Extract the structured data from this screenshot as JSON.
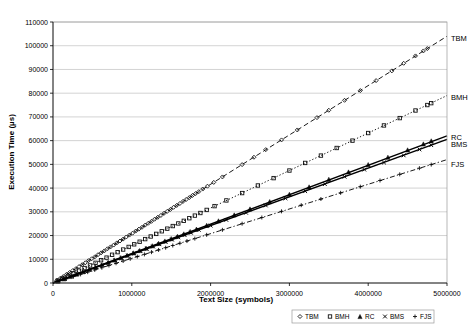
{
  "chart_data": {
    "type": "scatter",
    "title": "",
    "xlabel": "Text Size (symbols)",
    "ylabel": "Execution Time (µs)",
    "xlim": [
      0,
      5000000
    ],
    "ylim": [
      0,
      110000
    ],
    "xticks": [
      0,
      1000000,
      2000000,
      3000000,
      4000000,
      5000000
    ],
    "xtick_labels": [
      "0",
      "1000000",
      "2000000",
      "3000000",
      "4000000",
      "5000000"
    ],
    "yticks": [
      0,
      10000,
      20000,
      30000,
      40000,
      50000,
      60000,
      70000,
      80000,
      90000,
      100000,
      110000
    ],
    "ytick_labels": [
      "0",
      "10000",
      "20000",
      "30000",
      "40000",
      "50000",
      "60000",
      "70000",
      "80000",
      "90000",
      "100000",
      "110000"
    ],
    "grid": "horizontal",
    "legend_position": "below-right",
    "legend_entries": [
      {
        "label": "TBM",
        "marker": "diamond"
      },
      {
        "label": "BMH",
        "marker": "square"
      },
      {
        "label": "RC",
        "marker": "triangle"
      },
      {
        "label": "BMS",
        "marker": "cross-x"
      },
      {
        "label": "FJS",
        "marker": "plus"
      }
    ],
    "series": [
      {
        "name": "TBM",
        "marker": "diamond",
        "trend_style": "dashed",
        "slope_per_symbol": 0.0208,
        "end_label": "TBM",
        "end_label_y": 103000,
        "points": [
          [
            50000,
            1100
          ],
          [
            90000,
            1900
          ],
          [
            130000,
            2700
          ],
          [
            170000,
            3600
          ],
          [
            210000,
            4400
          ],
          [
            250000,
            5200
          ],
          [
            290000,
            6000
          ],
          [
            330000,
            6900
          ],
          [
            370000,
            7700
          ],
          [
            410000,
            8500
          ],
          [
            450000,
            9400
          ],
          [
            490000,
            10200
          ],
          [
            530000,
            11000
          ],
          [
            570000,
            11900
          ],
          [
            610000,
            12700
          ],
          [
            650000,
            13500
          ],
          [
            690000,
            14400
          ],
          [
            730000,
            15200
          ],
          [
            770000,
            16000
          ],
          [
            810000,
            16900
          ],
          [
            850000,
            17700
          ],
          [
            890000,
            18500
          ],
          [
            930000,
            19400
          ],
          [
            970000,
            20200
          ],
          [
            1010000,
            21000
          ],
          [
            1050000,
            21900
          ],
          [
            1090000,
            22700
          ],
          [
            1130000,
            23500
          ],
          [
            1170000,
            24400
          ],
          [
            1210000,
            25200
          ],
          [
            1250000,
            26000
          ],
          [
            1290000,
            26900
          ],
          [
            1330000,
            27700
          ],
          [
            1370000,
            28500
          ],
          [
            1410000,
            29400
          ],
          [
            1450000,
            30200
          ],
          [
            1490000,
            31000
          ],
          [
            1530000,
            31900
          ],
          [
            1570000,
            32700
          ],
          [
            1610000,
            33500
          ],
          [
            1650000,
            34400
          ],
          [
            1690000,
            35200
          ],
          [
            1730000,
            36000
          ],
          [
            1770000,
            36900
          ],
          [
            1810000,
            37700
          ],
          [
            1850000,
            38500
          ],
          [
            1900000,
            39600
          ],
          [
            1960000,
            40800
          ],
          [
            2040000,
            42400
          ],
          [
            2150000,
            44700
          ],
          [
            2400000,
            49900
          ],
          [
            2550000,
            53000
          ],
          [
            2700000,
            56200
          ],
          [
            2900000,
            60300
          ],
          [
            3100000,
            64500
          ],
          [
            3350000,
            69700
          ],
          [
            3500000,
            72800
          ],
          [
            3700000,
            77000
          ],
          [
            3900000,
            81100
          ],
          [
            4100000,
            85300
          ],
          [
            4300000,
            89400
          ],
          [
            4450000,
            92600
          ],
          [
            4600000,
            95700
          ],
          [
            4700000,
            97800
          ],
          [
            4750000,
            98800
          ]
        ]
      },
      {
        "name": "BMH",
        "marker": "square",
        "trend_style": "dotted",
        "slope_per_symbol": 0.0158,
        "end_label": "BMH",
        "end_label_y": 78000,
        "points": [
          [
            60000,
            1000
          ],
          [
            120000,
            1900
          ],
          [
            190000,
            3000
          ],
          [
            260000,
            4100
          ],
          [
            330000,
            5200
          ],
          [
            400000,
            6300
          ],
          [
            470000,
            7400
          ],
          [
            540000,
            8500
          ],
          [
            610000,
            9600
          ],
          [
            680000,
            10700
          ],
          [
            750000,
            11900
          ],
          [
            820000,
            13000
          ],
          [
            890000,
            14100
          ],
          [
            960000,
            15200
          ],
          [
            1030000,
            16300
          ],
          [
            1100000,
            17400
          ],
          [
            1170000,
            18500
          ],
          [
            1240000,
            19600
          ],
          [
            1310000,
            20700
          ],
          [
            1380000,
            21800
          ],
          [
            1450000,
            22900
          ],
          [
            1520000,
            24000
          ],
          [
            1590000,
            25100
          ],
          [
            1660000,
            26200
          ],
          [
            1730000,
            27300
          ],
          [
            1800000,
            28400
          ],
          [
            1870000,
            29500
          ],
          [
            1950000,
            30800
          ],
          [
            2050000,
            32400
          ],
          [
            2200000,
            34800
          ],
          [
            2400000,
            37900
          ],
          [
            2600000,
            41100
          ],
          [
            2800000,
            44200
          ],
          [
            3000000,
            47400
          ],
          [
            3200000,
            50600
          ],
          [
            3400000,
            53700
          ],
          [
            3600000,
            56900
          ],
          [
            3800000,
            60000
          ],
          [
            4000000,
            63200
          ],
          [
            4200000,
            66400
          ],
          [
            4400000,
            69500
          ],
          [
            4600000,
            72700
          ],
          [
            4750000,
            75000
          ],
          [
            4800000,
            75800
          ]
        ]
      },
      {
        "name": "RC",
        "marker": "triangle",
        "trend_style": "solid",
        "slope_per_symbol": 0.0124,
        "end_label": "RC",
        "end_label_y": 61500,
        "points": [
          [
            60000,
            750
          ],
          [
            140000,
            1750
          ],
          [
            220000,
            2750
          ],
          [
            300000,
            3750
          ],
          [
            380000,
            4750
          ],
          [
            460000,
            5750
          ],
          [
            540000,
            6750
          ],
          [
            620000,
            7700
          ],
          [
            700000,
            8700
          ],
          [
            780000,
            9700
          ],
          [
            860000,
            10700
          ],
          [
            940000,
            11700
          ],
          [
            1020000,
            12700
          ],
          [
            1100000,
            13700
          ],
          [
            1180000,
            14700
          ],
          [
            1260000,
            15700
          ],
          [
            1340000,
            16700
          ],
          [
            1420000,
            17700
          ],
          [
            1500000,
            18700
          ],
          [
            1580000,
            19700
          ],
          [
            1660000,
            20700
          ],
          [
            1740000,
            21700
          ],
          [
            1820000,
            22700
          ],
          [
            1950000,
            24300
          ],
          [
            2100000,
            26200
          ],
          [
            2300000,
            28700
          ],
          [
            2500000,
            31200
          ],
          [
            2750000,
            34300
          ],
          [
            3000000,
            37400
          ],
          [
            3250000,
            40500
          ],
          [
            3500000,
            43700
          ],
          [
            3750000,
            46800
          ],
          [
            4000000,
            49900
          ],
          [
            4250000,
            53000
          ],
          [
            4500000,
            56100
          ],
          [
            4700000,
            58600
          ],
          [
            4800000,
            59900
          ]
        ]
      },
      {
        "name": "BMS",
        "marker": "cross-x",
        "trend_style": "solid",
        "slope_per_symbol": 0.0121,
        "end_label": "BMS",
        "end_label_y": 58500,
        "points": [
          [
            70000,
            850
          ],
          [
            150000,
            1820
          ],
          [
            230000,
            2790
          ],
          [
            310000,
            3760
          ],
          [
            390000,
            4720
          ],
          [
            470000,
            5690
          ],
          [
            550000,
            6660
          ],
          [
            630000,
            7630
          ],
          [
            710000,
            8600
          ],
          [
            790000,
            9560
          ],
          [
            870000,
            10530
          ],
          [
            950000,
            11500
          ],
          [
            1030000,
            12470
          ],
          [
            1110000,
            13440
          ],
          [
            1190000,
            14400
          ],
          [
            1270000,
            15370
          ],
          [
            1350000,
            16340
          ],
          [
            1430000,
            17310
          ],
          [
            1510000,
            18280
          ],
          [
            1590000,
            19240
          ],
          [
            1670000,
            20210
          ],
          [
            1750000,
            21180
          ],
          [
            1850000,
            22400
          ],
          [
            2000000,
            24200
          ],
          [
            2200000,
            26600
          ],
          [
            2450000,
            29600
          ],
          [
            2700000,
            32700
          ],
          [
            2950000,
            35700
          ],
          [
            3200000,
            38700
          ],
          [
            3450000,
            41700
          ],
          [
            3700000,
            44800
          ],
          [
            3950000,
            47800
          ],
          [
            4200000,
            50800
          ],
          [
            4450000,
            53800
          ],
          [
            4650000,
            56300
          ],
          [
            4800000,
            58100
          ]
        ]
      },
      {
        "name": "FJS",
        "marker": "plus",
        "trend_style": "dash-dot",
        "slope_per_symbol": 0.0104,
        "end_label": "FJS",
        "end_label_y": 50000,
        "points": [
          [
            80000,
            830
          ],
          [
            170000,
            1770
          ],
          [
            260000,
            2700
          ],
          [
            350000,
            3640
          ],
          [
            440000,
            4580
          ],
          [
            530000,
            5510
          ],
          [
            620000,
            6450
          ],
          [
            710000,
            7380
          ],
          [
            800000,
            8320
          ],
          [
            890000,
            9260
          ],
          [
            980000,
            10190
          ],
          [
            1070000,
            11130
          ],
          [
            1160000,
            12060
          ],
          [
            1250000,
            13000
          ],
          [
            1340000,
            13940
          ],
          [
            1430000,
            14870
          ],
          [
            1520000,
            15810
          ],
          [
            1610000,
            16740
          ],
          [
            1700000,
            17680
          ],
          [
            1800000,
            18700
          ],
          [
            1950000,
            20300
          ],
          [
            2150000,
            22400
          ],
          [
            2400000,
            25000
          ],
          [
            2650000,
            27600
          ],
          [
            2900000,
            30200
          ],
          [
            3150000,
            32800
          ],
          [
            3400000,
            35400
          ],
          [
            3650000,
            38000
          ],
          [
            3900000,
            40600
          ],
          [
            4150000,
            43200
          ],
          [
            4400000,
            45800
          ],
          [
            4650000,
            48400
          ],
          [
            4800000,
            49900
          ]
        ]
      }
    ]
  }
}
